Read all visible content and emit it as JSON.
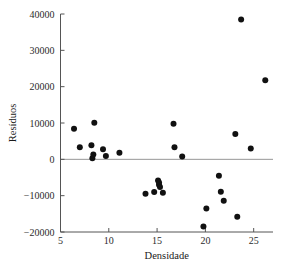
{
  "chart_data": {
    "type": "scatter",
    "title": "",
    "xlabel": "Densidade",
    "ylabel": "Resíduos",
    "xlim": [
      5,
      27
    ],
    "ylim": [
      -20000,
      40000
    ],
    "xticks": [
      5,
      10,
      15,
      20,
      25
    ],
    "yticks": [
      -20000,
      -10000,
      0,
      10000,
      20000,
      30000,
      40000
    ],
    "xtick_labels": [
      "5",
      "10",
      "15",
      "20",
      "25"
    ],
    "ytick_labels": [
      "-20000",
      "-10000",
      "0",
      "10000",
      "20000",
      "30000",
      "40000"
    ],
    "grid": false,
    "legend": null,
    "reference_lines": [
      {
        "orientation": "horizontal",
        "value": 0
      }
    ],
    "marker": {
      "shape": "circle",
      "color": "#111111",
      "size": 3
    },
    "points": [
      {
        "x": 6.4,
        "y": 8400
      },
      {
        "x": 7.0,
        "y": 3300
      },
      {
        "x": 8.2,
        "y": 3900
      },
      {
        "x": 8.3,
        "y": 300
      },
      {
        "x": 8.4,
        "y": 1300
      },
      {
        "x": 8.5,
        "y": 10100
      },
      {
        "x": 9.4,
        "y": 2800
      },
      {
        "x": 9.7,
        "y": 900
      },
      {
        "x": 11.1,
        "y": 1800
      },
      {
        "x": 13.8,
        "y": -9500
      },
      {
        "x": 14.7,
        "y": -9000
      },
      {
        "x": 15.1,
        "y": -5800
      },
      {
        "x": 15.2,
        "y": -7000
      },
      {
        "x": 15.2,
        "y": -6400
      },
      {
        "x": 15.3,
        "y": -7600
      },
      {
        "x": 15.6,
        "y": -9200
      },
      {
        "x": 16.7,
        "y": 9800
      },
      {
        "x": 16.8,
        "y": 3300
      },
      {
        "x": 17.6,
        "y": 800
      },
      {
        "x": 19.8,
        "y": -18500
      },
      {
        "x": 20.1,
        "y": -13500
      },
      {
        "x": 21.4,
        "y": -4500
      },
      {
        "x": 21.6,
        "y": -8900
      },
      {
        "x": 21.9,
        "y": -11400
      },
      {
        "x": 23.1,
        "y": 7000
      },
      {
        "x": 23.3,
        "y": -15800
      },
      {
        "x": 23.7,
        "y": 38500
      },
      {
        "x": 24.7,
        "y": 3000
      },
      {
        "x": 26.2,
        "y": 21800
      }
    ]
  }
}
